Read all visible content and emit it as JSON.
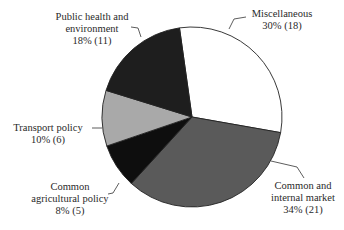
{
  "chart_data": {
    "type": "pie",
    "title": "",
    "start_angle_deg": -8,
    "direction": "clockwise",
    "slices": [
      {
        "label": "Miscellaneous",
        "percent": 30,
        "count": 18,
        "color": "#ffffff",
        "pct_text": "30% (18)"
      },
      {
        "label": "Common and internal market",
        "percent": 34,
        "count": 21,
        "color": "#5a5a5a",
        "pct_text": "34% (21)"
      },
      {
        "label": "Common agricultural policy",
        "percent": 8,
        "count": 5,
        "color": "#0e0e0e",
        "pct_text": "8% (5)"
      },
      {
        "label": "Transport policy",
        "percent": 10,
        "count": 6,
        "color": "#a9a9a9",
        "pct_text": "10% (6)"
      },
      {
        "label": "Public health and environment",
        "percent": 18,
        "count": 11,
        "color": "#1e1e1e",
        "pct_text": "18% (11)"
      }
    ]
  },
  "labels": {
    "misc": {
      "line1": "Miscellaneous",
      "line2": "30% (18)"
    },
    "market": {
      "line1": "Common and",
      "line2": "internal market",
      "line3": "34% (21)"
    },
    "agri": {
      "line1": "Common",
      "line2": "agricultural policy",
      "line3": "8% (5)"
    },
    "transport": {
      "line1": "Transport policy",
      "line2": "10% (6)"
    },
    "health": {
      "line1": "Public health and",
      "line2": "environment",
      "line3": "18% (11)"
    }
  }
}
